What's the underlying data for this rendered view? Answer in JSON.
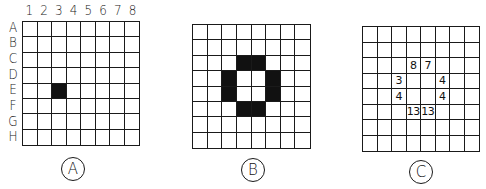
{
  "column_labels": [
    "1",
    "2",
    "3",
    "4",
    "5",
    "6",
    "7",
    "8"
  ],
  "row_labels": [
    "A",
    "B",
    "C",
    "D",
    "E",
    "F",
    "G",
    "H"
  ],
  "panels": [
    {
      "label": "A",
      "grid": {
        "x": 22,
        "y": 21,
        "w": 118,
        "h": 125
      },
      "show_axis_labels": true,
      "filled_cells": [
        [
          "E",
          3
        ]
      ],
      "numbers": []
    },
    {
      "label": "B",
      "grid": {
        "x": 192,
        "y": 24,
        "w": 119,
        "h": 125
      },
      "show_axis_labels": false,
      "filled_cells": [
        [
          "C",
          4
        ],
        [
          "C",
          5
        ],
        [
          "D",
          3
        ],
        [
          "D",
          6
        ],
        [
          "E",
          3
        ],
        [
          "E",
          6
        ],
        [
          "F",
          4
        ],
        [
          "F",
          5
        ]
      ],
      "numbers": []
    },
    {
      "label": "C",
      "grid": {
        "x": 362,
        "y": 26,
        "w": 118,
        "h": 126
      },
      "show_axis_labels": false,
      "filled_cells": [],
      "numbers": [
        {
          "row": "C",
          "col": 4,
          "value": "8"
        },
        {
          "row": "C",
          "col": 5,
          "value": "7"
        },
        {
          "row": "D",
          "col": 3,
          "value": "3"
        },
        {
          "row": "D",
          "col": 6,
          "value": "4"
        },
        {
          "row": "E",
          "col": 3,
          "value": "4"
        },
        {
          "row": "E",
          "col": 6,
          "value": "4"
        },
        {
          "row": "F",
          "col": 4,
          "value": "13"
        },
        {
          "row": "F",
          "col": 5,
          "value": "13"
        }
      ]
    }
  ],
  "circle_labels": [
    {
      "text": "A",
      "cx": 73,
      "cy": 169
    },
    {
      "text": "B",
      "cx": 253,
      "cy": 170
    },
    {
      "text": "C",
      "cx": 421,
      "cy": 172
    }
  ]
}
